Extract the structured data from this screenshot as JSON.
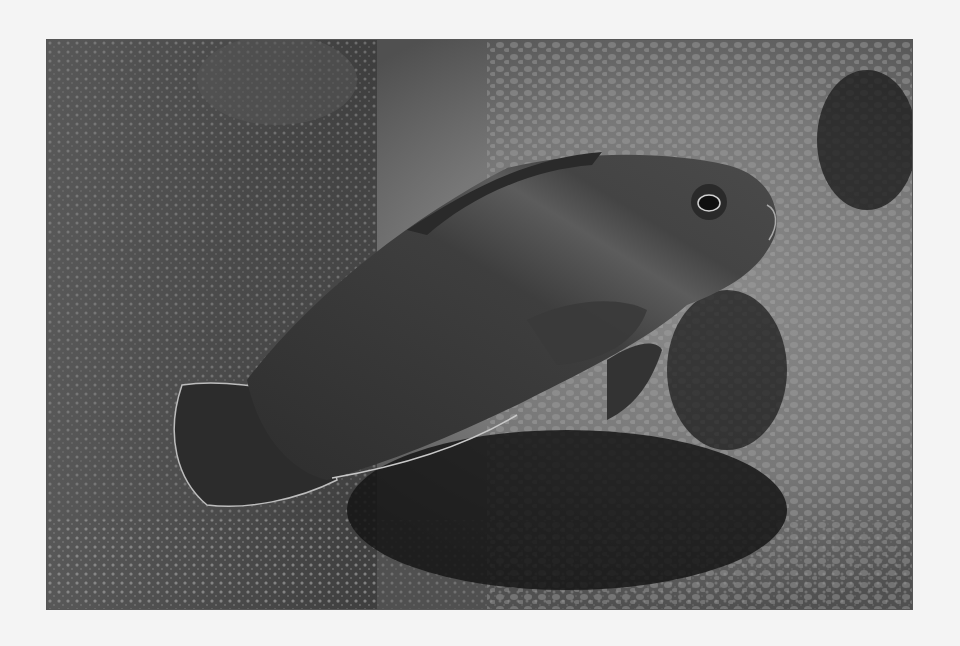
{
  "image": {
    "subject": "Dark fish resting on coral reef",
    "alt": "Grayscale photograph of a dark dottyback fish over coral and rocks",
    "tone": "grayscale",
    "colors": {
      "page_background": "#f4f4f4",
      "frame_border": "#555555",
      "reef_light": "#9a9a9a",
      "reef_mid": "#6e6e6e",
      "reef_dark": "#2e2e2e",
      "fish_body": "#3c3c3c",
      "fish_shadow": "#1a1a1a",
      "fin_edge": "#bdbdbd"
    }
  }
}
